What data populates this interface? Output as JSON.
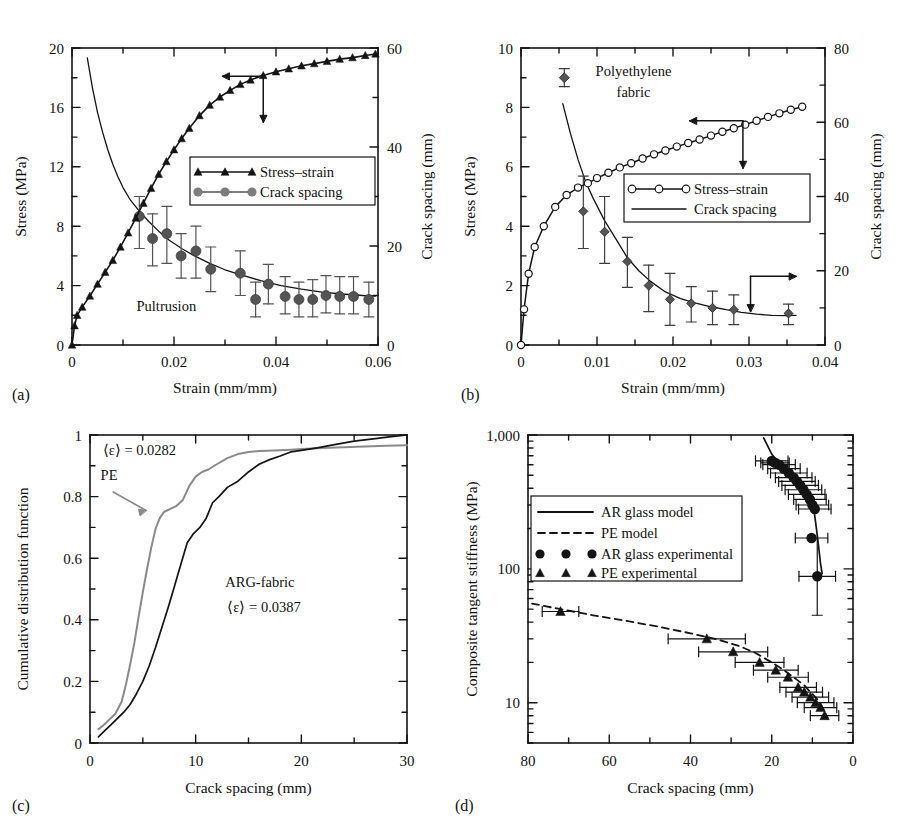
{
  "figure": {
    "panels": [
      "(a)",
      "(b)",
      "(c)",
      "(d)"
    ]
  },
  "colors": {
    "ink": "#141414",
    "gray_series": "#7d7d7d",
    "marker_gray": "#545454",
    "pe_curve": "#8a8a8a"
  },
  "panel_a": {
    "tag": "(a)",
    "annotation": "Pultrusion",
    "legend": [
      {
        "label": "Stress–strain",
        "marker": "triangle-black"
      },
      {
        "label": "Crack spacing",
        "marker": "circle-gray"
      }
    ],
    "chart_data": {
      "type": "line",
      "title": "Pultrusion",
      "xlabel": "Strain (mm/mm)",
      "ylabel": "Stress (MPa)",
      "y2label": "Crack spacing (mm)",
      "xlim": [
        0,
        0.06
      ],
      "ylim": [
        0,
        20
      ],
      "y2lim": [
        0,
        60
      ],
      "xticks": [
        0,
        0.02,
        0.04,
        0.06
      ],
      "xticklabels": [
        "0",
        "0.02",
        "0.04",
        "0.06"
      ],
      "xminor_step": 0.01,
      "yticks": [
        0,
        4,
        8,
        12,
        16,
        20
      ],
      "yticklabels": [
        "0",
        "4",
        "8",
        "12",
        "16",
        "20"
      ],
      "yminor_step": 2,
      "y2ticks": [
        0,
        20,
        40,
        60
      ],
      "y2ticklabels": [
        "0",
        "20",
        "40",
        "60"
      ],
      "y2minor_step": 10,
      "grid": false,
      "legend_position": "center",
      "series": [
        {
          "name": "Stress–strain",
          "axis": "left",
          "marker": "triangle",
          "color": "#141414",
          "x": [
            0.0,
            0.0005,
            0.001,
            0.002,
            0.0035,
            0.005,
            0.0065,
            0.008,
            0.0095,
            0.011,
            0.0125,
            0.014,
            0.0155,
            0.017,
            0.0185,
            0.02,
            0.0215,
            0.023,
            0.025,
            0.027,
            0.029,
            0.031,
            0.033,
            0.035,
            0.0375,
            0.04,
            0.0425,
            0.045,
            0.0475,
            0.05,
            0.0525,
            0.055,
            0.0575,
            0.0595
          ],
          "y": [
            0.0,
            1.3,
            2.0,
            2.55,
            3.3,
            4.1,
            4.9,
            5.7,
            6.6,
            7.55,
            8.55,
            9.55,
            10.55,
            11.5,
            12.35,
            13.15,
            13.9,
            14.6,
            15.45,
            16.15,
            16.7,
            17.15,
            17.55,
            17.85,
            18.15,
            18.4,
            18.6,
            18.8,
            18.95,
            19.1,
            19.25,
            19.35,
            19.5,
            19.6
          ]
        },
        {
          "name": "Crack spacing (fit curve)",
          "axis": "right",
          "marker": "none",
          "color": "#7d7d7d",
          "x": [
            0.003,
            0.004,
            0.005,
            0.006,
            0.007,
            0.008,
            0.009,
            0.01,
            0.0115,
            0.013,
            0.015,
            0.017,
            0.019,
            0.0215,
            0.024,
            0.027,
            0.03,
            0.033,
            0.037,
            0.041,
            0.045,
            0.049,
            0.053,
            0.057,
            0.0595
          ],
          "y": [
            58.0,
            52.0,
            47.0,
            43.0,
            39.5,
            36.5,
            34.0,
            31.8,
            29.2,
            27.3,
            25.0,
            23.0,
            21.2,
            19.5,
            18.0,
            16.5,
            15.2,
            14.2,
            13.0,
            12.0,
            11.3,
            10.7,
            10.3,
            10.0,
            9.9
          ]
        },
        {
          "name": "Crack spacing (data)",
          "axis": "right",
          "marker": "circle",
          "color": "#545454",
          "x": [
            0.0132,
            0.0158,
            0.0186,
            0.0214,
            0.0243,
            0.0272,
            0.033,
            0.036,
            0.0385,
            0.0418,
            0.0445,
            0.0472,
            0.0498,
            0.0525,
            0.0552,
            0.0582
          ],
          "y": [
            26.0,
            21.5,
            22.5,
            18.0,
            19.0,
            15.3,
            14.5,
            9.2,
            12.3,
            9.8,
            9.2,
            9.2,
            10.0,
            9.8,
            9.8,
            9.2
          ],
          "yerr_low": [
            6.5,
            5.5,
            6.0,
            4.5,
            5.5,
            4.5,
            4.5,
            3.5,
            4.0,
            3.5,
            3.5,
            3.5,
            3.5,
            3.5,
            3.5,
            3.5
          ],
          "yerr_high": [
            4.0,
            5.0,
            5.5,
            4.5,
            5.0,
            4.5,
            4.5,
            3.5,
            4.0,
            4.0,
            3.5,
            4.0,
            4.0,
            4.0,
            4.0,
            3.5
          ]
        }
      ],
      "annotations": [
        {
          "text": "Pultrusion",
          "x": 0.0135,
          "y": 2.2
        },
        {
          "text": "arrow-left-down",
          "kind": "axis-pointer"
        }
      ]
    }
  },
  "panel_b": {
    "tag": "(b)",
    "annotation_line1": "Polyethylene",
    "annotation_line2": "fabric",
    "legend": [
      {
        "label": "Stress–strain",
        "marker": "circle-open"
      },
      {
        "label": "Crack spacing",
        "marker": "line-plain"
      }
    ],
    "chart_data": {
      "type": "line",
      "title": "Polyethylene fabric",
      "xlabel": "Strain (mm/mm)",
      "ylabel": "Stress (MPa)",
      "y2label": "Crack spacing (mm)",
      "xlim": [
        0,
        0.04
      ],
      "ylim": [
        0,
        10
      ],
      "y2lim": [
        0,
        80
      ],
      "xticks": [
        0,
        0.01,
        0.02,
        0.03,
        0.04
      ],
      "xticklabels": [
        "0",
        "0.01",
        "0.02",
        "0.03",
        "0.04"
      ],
      "xminor_step": 0.005,
      "yticks": [
        0,
        2,
        4,
        6,
        8,
        10
      ],
      "yticklabels": [
        "0",
        "2",
        "4",
        "6",
        "8",
        "10"
      ],
      "yminor_step": 1,
      "y2ticks": [
        0,
        20,
        40,
        60,
        80
      ],
      "y2ticklabels": [
        "0",
        "20",
        "40",
        "60",
        "80"
      ],
      "y2minor_step": 10,
      "grid": false,
      "legend_position": "center-right",
      "series": [
        {
          "name": "Stress–strain",
          "axis": "left",
          "marker": "circle-open",
          "color": "#141414",
          "x": [
            0.0,
            0.0004,
            0.001,
            0.0018,
            0.003,
            0.0045,
            0.006,
            0.0075,
            0.0088,
            0.01,
            0.0115,
            0.013,
            0.0145,
            0.016,
            0.0175,
            0.019,
            0.0205,
            0.022,
            0.0235,
            0.025,
            0.0265,
            0.028,
            0.0295,
            0.031,
            0.0325,
            0.034,
            0.0355,
            0.037
          ],
          "y": [
            0.0,
            1.2,
            2.4,
            3.3,
            4.0,
            4.65,
            5.05,
            5.3,
            5.45,
            5.62,
            5.8,
            5.98,
            6.12,
            6.28,
            6.42,
            6.55,
            6.68,
            6.8,
            6.92,
            7.05,
            7.18,
            7.3,
            7.42,
            7.55,
            7.68,
            7.8,
            7.92,
            8.02
          ]
        },
        {
          "name": "Crack spacing (fit curve)",
          "axis": "right",
          "marker": "none",
          "color": "#141414",
          "x": [
            0.0055,
            0.0065,
            0.0075,
            0.0085,
            0.0095,
            0.011,
            0.0125,
            0.014,
            0.0155,
            0.017,
            0.019,
            0.021,
            0.023,
            0.025,
            0.027,
            0.029,
            0.031,
            0.033,
            0.035,
            0.0362
          ],
          "y": [
            65.0,
            57.0,
            50.0,
            44.0,
            39.5,
            33.5,
            28.5,
            23.5,
            20.0,
            17.2,
            14.3,
            12.5,
            11.3,
            10.3,
            9.5,
            8.8,
            8.3,
            8.0,
            7.9,
            8.0
          ]
        },
        {
          "name": "Crack spacing (data)",
          "axis": "right",
          "marker": "diamond",
          "color": "#545454",
          "x": [
            0.0082,
            0.011,
            0.014,
            0.0168,
            0.0196,
            0.0224,
            0.0252,
            0.028,
            0.0352
          ],
          "y": [
            36.0,
            30.5,
            22.5,
            16.0,
            12.3,
            11.2,
            10.0,
            9.5,
            8.5
          ],
          "yerr_low": [
            10.0,
            8.5,
            7.0,
            7.0,
            7.0,
            5.0,
            4.5,
            4.0,
            3.0
          ],
          "yerr_high": [
            9.5,
            9.5,
            6.5,
            5.5,
            7.0,
            4.5,
            4.5,
            4.0,
            2.5
          ]
        }
      ],
      "annotations": [
        {
          "text": "Polyethylene",
          "x": 0.0115,
          "y": 9.1
        },
        {
          "text": "fabric",
          "x": 0.0128,
          "y": 8.35
        },
        {
          "text": "marker-sample-diamond",
          "kind": "sample"
        },
        {
          "text": "arrow-left-down",
          "kind": "axis-pointer"
        },
        {
          "text": "arrow-right-down",
          "kind": "axis-pointer"
        }
      ]
    }
  },
  "panel_c": {
    "tag": "(c)",
    "annotations": {
      "pe_eps": "⟨ε⟩ = 0.0282",
      "pe_label": "PE",
      "arg_label": "ARG-fabric",
      "arg_eps": "⟨ε⟩ = 0.0387"
    },
    "chart_data": {
      "type": "line",
      "title": "",
      "xlabel": "Crack spacing (mm)",
      "ylabel": "Cumulative distribution function",
      "xlim": [
        0,
        30
      ],
      "ylim": [
        0,
        1
      ],
      "xticks": [
        0,
        10,
        20,
        30
      ],
      "xticklabels": [
        "0",
        "10",
        "20",
        "30"
      ],
      "xminor_step": 5,
      "yticks": [
        0,
        0.2,
        0.4,
        0.6,
        0.8,
        1
      ],
      "yticklabels": [
        "0",
        "0.2",
        "0.4",
        "0.6",
        "0.8",
        "1"
      ],
      "yminor_step": 0.1,
      "grid": false,
      "legend_position": "none",
      "series": [
        {
          "name": "PE",
          "color": "#8a8a8a",
          "x": [
            0.8,
            1.2,
            1.8,
            2.4,
            3.0,
            3.4,
            3.8,
            4.2,
            4.6,
            5.0,
            5.4,
            5.8,
            6.2,
            6.6,
            7.0,
            7.6,
            8.2,
            8.8,
            9.4,
            10.0,
            10.6,
            11.2,
            12.0,
            13.0,
            14.0,
            15.0,
            16.0,
            17.5,
            19.0,
            20.5,
            22.0,
            24.0,
            26.0,
            28.0,
            30.0
          ],
          "y": [
            0.045,
            0.055,
            0.075,
            0.095,
            0.135,
            0.19,
            0.255,
            0.325,
            0.41,
            0.49,
            0.565,
            0.635,
            0.695,
            0.73,
            0.75,
            0.76,
            0.77,
            0.79,
            0.835,
            0.865,
            0.88,
            0.888,
            0.905,
            0.925,
            0.938,
            0.945,
            0.948,
            0.95,
            0.952,
            0.955,
            0.958,
            0.96,
            0.963,
            0.965,
            0.967
          ]
        },
        {
          "name": "ARG-fabric",
          "color": "#141414",
          "x": [
            0.8,
            1.4,
            2.0,
            2.6,
            3.2,
            3.8,
            4.4,
            5.0,
            5.6,
            6.2,
            6.8,
            7.4,
            8.0,
            8.6,
            9.2,
            9.8,
            10.4,
            11.0,
            11.6,
            12.2,
            13.0,
            14.0,
            15.0,
            16.0,
            17.0,
            18.0,
            19.0,
            20.0,
            21.5,
            23.0,
            25.0,
            27.0,
            28.5,
            30.0
          ],
          "y": [
            0.02,
            0.04,
            0.06,
            0.08,
            0.1,
            0.125,
            0.16,
            0.2,
            0.25,
            0.31,
            0.375,
            0.44,
            0.51,
            0.58,
            0.65,
            0.68,
            0.7,
            0.73,
            0.78,
            0.8,
            0.83,
            0.85,
            0.88,
            0.905,
            0.92,
            0.932,
            0.945,
            0.95,
            0.958,
            0.968,
            0.98,
            0.988,
            0.995,
            1.0
          ]
        }
      ]
    }
  },
  "panel_d": {
    "tag": "(d)",
    "legend": [
      {
        "label": "AR glass model",
        "marker": "line-solid"
      },
      {
        "label": "PE model",
        "marker": "line-dashed"
      },
      {
        "label": "AR glass experimental",
        "marker": "circle-filled"
      },
      {
        "label": "PE experimental",
        "marker": "triangle-filled"
      }
    ],
    "chart_data": {
      "type": "scatter",
      "title": "",
      "xlabel": "Crack spacing (mm)",
      "ylabel": "Composite tangent stiffness (MPa)",
      "xlim": [
        80,
        0
      ],
      "ylim": [
        5,
        1000
      ],
      "yscale": "log",
      "xticks": [
        80,
        60,
        40,
        20,
        0
      ],
      "xticklabels": [
        "80",
        "60",
        "40",
        "20",
        "0"
      ],
      "xminor_step": 10,
      "yticks": [
        10,
        100,
        1000
      ],
      "yticklabels": [
        "10",
        "100",
        "1,000"
      ],
      "grid": false,
      "legend_position": "upper-left",
      "series": [
        {
          "name": "AR glass model",
          "style": "solid",
          "color": "#141414",
          "x": [
            22.0,
            20.0,
            18.0,
            16.0,
            14.0,
            12.5,
            11.5,
            10.5,
            9.5,
            9.0,
            8.5,
            8.0,
            7.6
          ],
          "y": [
            950.0,
            720.0,
            600.0,
            530.0,
            470.0,
            420.0,
            380.0,
            330.0,
            260.0,
            200.0,
            150.0,
            110.0,
            92.0
          ]
        },
        {
          "name": "PE model",
          "style": "dashed",
          "color": "#141414",
          "x": [
            79.0,
            72.0,
            64.0,
            56.0,
            48.0,
            40.0,
            34.0,
            28.0,
            24.0,
            20.0,
            17.0,
            14.0,
            12.0,
            10.5,
            9.0,
            8.0,
            7.0,
            6.2
          ],
          "y": [
            55.0,
            50.0,
            45.0,
            41.0,
            37.0,
            33.0,
            30.0,
            26.5,
            23.5,
            20.0,
            17.5,
            15.0,
            13.5,
            12.0,
            10.8,
            9.8,
            8.6,
            7.6
          ]
        },
        {
          "name": "AR glass experimental",
          "marker": "circle",
          "color": "#141414",
          "x": [
            20.0,
            19.2,
            18.2,
            17.0,
            15.8,
            14.6,
            13.8,
            13.0,
            12.2,
            11.4,
            10.6,
            10.0,
            9.4,
            10.2,
            8.8
          ],
          "y": [
            640.0,
            620.0,
            600.0,
            560.0,
            520.0,
            480.0,
            450.0,
            420.0,
            390.0,
            360.0,
            330.0,
            300.0,
            280.0,
            170.0,
            88.0
          ],
          "xerr": [
            4.0,
            3.5,
            4.0,
            4.0,
            4.5,
            4.5,
            4.5,
            4.5,
            4.5,
            4.5,
            4.0,
            4.0,
            4.0,
            4.0,
            4.5
          ]
        },
        {
          "name": "PE experimental",
          "marker": "triangle",
          "color": "#141414",
          "x": [
            72.0,
            36.0,
            29.5,
            23.0,
            19.0,
            16.0,
            13.5,
            12.0,
            10.5,
            9.2,
            8.0,
            7.0
          ],
          "y": [
            48.0,
            30.0,
            24.0,
            20.0,
            17.5,
            15.5,
            13.0,
            12.0,
            11.0,
            10.0,
            9.2,
            8.0
          ],
          "xerr": [
            4.5,
            9.5,
            8.5,
            6.0,
            5.5,
            5.0,
            4.5,
            4.5,
            4.5,
            4.5,
            4.0,
            3.5
          ]
        }
      ]
    }
  }
}
